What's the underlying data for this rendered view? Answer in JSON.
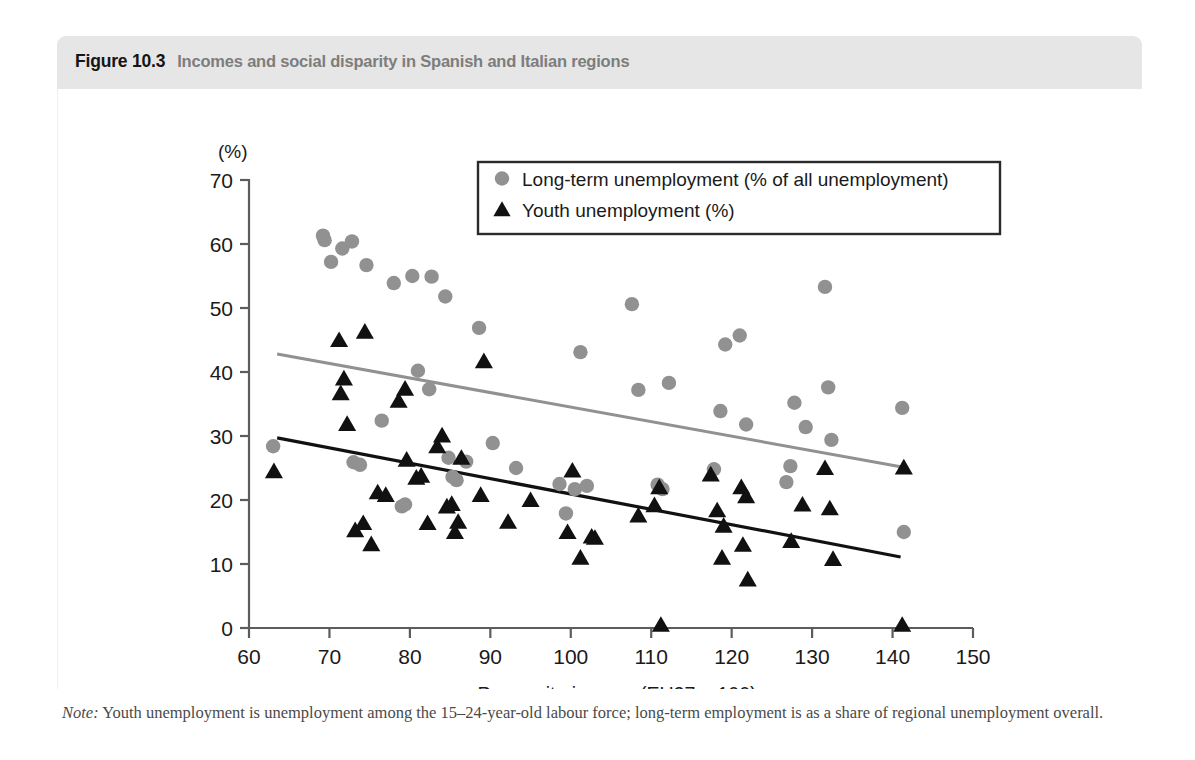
{
  "figure": {
    "number": "Figure 10.3",
    "title": "Incomes and social disparity in Spanish and Italian regions",
    "note_label": "Note:",
    "note_text": " Youth unemployment is unemployment among the 15–24-year-old labour force; long-term employment is as a share of regional unemployment overall.",
    "header_bg": "#e6e6e6"
  },
  "chart_data": {
    "type": "scatter",
    "title": "Incomes and social disparity in Spanish and Italian regions",
    "xlabel": "Per-capita income (EU27 = 100)",
    "ylabel": "(%)",
    "unit_label": "(%)",
    "xlim": [
      60,
      150
    ],
    "ylim": [
      0,
      70
    ],
    "xticks": [
      60,
      70,
      80,
      90,
      100,
      110,
      120,
      130,
      140,
      150
    ],
    "yticks": [
      0,
      10,
      20,
      30,
      40,
      50,
      60,
      70
    ],
    "grid": false,
    "legend_position": "top-center",
    "series": [
      {
        "name": "Long-term unemployment (% of all unemployment)",
        "marker": "circle",
        "color": "#919191",
        "points": [
          [
            63.0,
            28.4
          ],
          [
            69.2,
            61.3
          ],
          [
            69.4,
            60.6
          ],
          [
            70.2,
            57.2
          ],
          [
            71.6,
            59.3
          ],
          [
            72.8,
            60.4
          ],
          [
            74.6,
            56.7
          ],
          [
            73.0,
            25.9
          ],
          [
            73.8,
            25.5
          ],
          [
            76.5,
            32.4
          ],
          [
            78.0,
            53.9
          ],
          [
            79.0,
            19.0
          ],
          [
            79.4,
            19.3
          ],
          [
            80.3,
            55.0
          ],
          [
            81.0,
            40.2
          ],
          [
            82.4,
            37.3
          ],
          [
            82.7,
            54.9
          ],
          [
            84.4,
            51.8
          ],
          [
            84.8,
            26.6
          ],
          [
            85.3,
            23.6
          ],
          [
            85.8,
            23.1
          ],
          [
            87.0,
            26.0
          ],
          [
            88.6,
            46.9
          ],
          [
            90.3,
            28.9
          ],
          [
            93.2,
            25.0
          ],
          [
            98.6,
            22.5
          ],
          [
            99.4,
            17.9
          ],
          [
            100.5,
            21.7
          ],
          [
            101.2,
            43.1
          ],
          [
            102.0,
            22.2
          ],
          [
            107.6,
            50.6
          ],
          [
            108.4,
            37.2
          ],
          [
            110.8,
            22.4
          ],
          [
            111.4,
            21.7
          ],
          [
            112.2,
            38.3
          ],
          [
            117.8,
            24.8
          ],
          [
            118.6,
            33.9
          ],
          [
            119.2,
            44.3
          ],
          [
            121.0,
            45.7
          ],
          [
            121.8,
            31.8
          ],
          [
            126.8,
            22.8
          ],
          [
            127.3,
            25.3
          ],
          [
            127.8,
            35.2
          ],
          [
            129.2,
            31.4
          ],
          [
            131.6,
            53.3
          ],
          [
            132.0,
            37.6
          ],
          [
            132.4,
            29.4
          ],
          [
            141.2,
            34.4
          ],
          [
            141.4,
            15.0
          ]
        ]
      },
      {
        "name": "Youth unemployment (%)",
        "marker": "triangle",
        "color": "#111111",
        "points": [
          [
            63.1,
            24.5
          ],
          [
            71.2,
            45.0
          ],
          [
            71.8,
            39.0
          ],
          [
            71.4,
            36.7
          ],
          [
            72.2,
            31.9
          ],
          [
            74.4,
            46.3
          ],
          [
            73.2,
            15.3
          ],
          [
            74.2,
            16.4
          ],
          [
            75.2,
            13.1
          ],
          [
            76.0,
            21.2
          ],
          [
            77.0,
            20.8
          ],
          [
            78.6,
            35.5
          ],
          [
            79.4,
            37.4
          ],
          [
            79.6,
            26.3
          ],
          [
            80.8,
            23.5
          ],
          [
            81.4,
            23.8
          ],
          [
            82.2,
            16.4
          ],
          [
            83.4,
            28.4
          ],
          [
            84.0,
            30.1
          ],
          [
            84.6,
            19.0
          ],
          [
            85.2,
            19.4
          ],
          [
            85.6,
            15.0
          ],
          [
            86.4,
            26.6
          ],
          [
            86.0,
            16.6
          ],
          [
            89.2,
            41.7
          ],
          [
            88.8,
            20.8
          ],
          [
            92.2,
            16.6
          ],
          [
            95.0,
            20.0
          ],
          [
            99.6,
            15.0
          ],
          [
            100.2,
            24.6
          ],
          [
            101.2,
            11.0
          ],
          [
            102.6,
            14.3
          ],
          [
            103.0,
            14.1
          ],
          [
            108.4,
            17.6
          ],
          [
            110.4,
            19.2
          ],
          [
            111.2,
            0.5
          ],
          [
            111.0,
            22.0
          ],
          [
            117.4,
            24.0
          ],
          [
            118.2,
            18.4
          ],
          [
            118.8,
            11.0
          ],
          [
            119.0,
            16.0
          ],
          [
            121.2,
            22.0
          ],
          [
            121.8,
            20.6
          ],
          [
            121.4,
            13.0
          ],
          [
            122.0,
            7.6
          ],
          [
            127.4,
            13.6
          ],
          [
            128.8,
            19.3
          ],
          [
            131.6,
            25.0
          ],
          [
            132.2,
            18.7
          ],
          [
            132.6,
            10.8
          ],
          [
            141.2,
            0.5
          ],
          [
            141.4,
            25.1
          ]
        ]
      }
    ],
    "trendlines": [
      {
        "name": "Long-term unemployment trend",
        "color": "#919191",
        "x0": 63.5,
        "y0": 42.8,
        "x1": 141.0,
        "y1": 25.2
      },
      {
        "name": "Youth unemployment trend",
        "color": "#111111",
        "x0": 63.5,
        "y0": 29.7,
        "x1": 141.0,
        "y1": 11.1
      }
    ],
    "legend": [
      {
        "label": "Long-term unemployment (% of all unemployment)",
        "marker": "circle",
        "color": "#919191"
      },
      {
        "label": "Youth unemployment (%)",
        "marker": "triangle",
        "color": "#111111"
      }
    ]
  }
}
